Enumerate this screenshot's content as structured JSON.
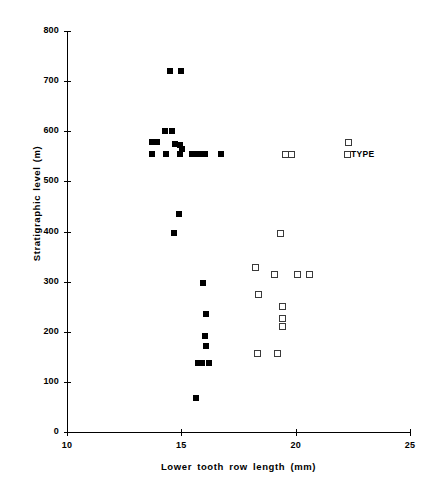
{
  "chart_data": {
    "type": "scatter",
    "title": "",
    "xlabel": "Lower tooth row length (mm)",
    "ylabel": "Stratigraphic level (m)",
    "xlim": [
      10,
      25
    ],
    "ylim": [
      0,
      800
    ],
    "xticks": [
      10,
      15,
      20,
      25
    ],
    "yticks": [
      0,
      100,
      200,
      300,
      400,
      500,
      600,
      700,
      800
    ],
    "grid": false,
    "legend": "none",
    "annotations": [
      {
        "text": "TYPE",
        "x": 22.25,
        "y": 555
      }
    ],
    "series": [
      {
        "name": "filled",
        "marker": "filled-square",
        "color": "#000000",
        "points": [
          [
            14.52,
            720
          ],
          [
            14.97,
            720
          ],
          [
            14.27,
            600
          ],
          [
            14.57,
            600
          ],
          [
            13.72,
            578
          ],
          [
            13.92,
            578
          ],
          [
            14.72,
            575
          ],
          [
            14.92,
            572
          ],
          [
            15.02,
            565
          ],
          [
            13.7,
            555
          ],
          [
            14.35,
            555
          ],
          [
            14.95,
            555
          ],
          [
            15.45,
            555
          ],
          [
            15.65,
            555
          ],
          [
            15.85,
            555
          ],
          [
            16.05,
            555
          ],
          [
            16.72,
            555
          ],
          [
            14.9,
            435
          ],
          [
            14.7,
            397
          ],
          [
            15.95,
            297
          ],
          [
            16.1,
            235
          ],
          [
            16.05,
            192
          ],
          [
            16.07,
            172
          ],
          [
            15.72,
            137
          ],
          [
            15.9,
            137
          ],
          [
            16.22,
            137
          ],
          [
            15.65,
            67
          ]
        ]
      },
      {
        "name": "open",
        "marker": "open-square",
        "color": "#3a3a3a",
        "points": [
          [
            22.3,
            578
          ],
          [
            19.55,
            555
          ],
          [
            19.78,
            555
          ],
          [
            22.25,
            555
          ],
          [
            19.33,
            397
          ],
          [
            18.2,
            330
          ],
          [
            19.05,
            315
          ],
          [
            20.07,
            315
          ],
          [
            20.58,
            315
          ],
          [
            18.35,
            275
          ],
          [
            19.4,
            252
          ],
          [
            19.4,
            228
          ],
          [
            19.4,
            212
          ],
          [
            18.33,
            157
          ],
          [
            19.2,
            157
          ]
        ]
      }
    ]
  }
}
